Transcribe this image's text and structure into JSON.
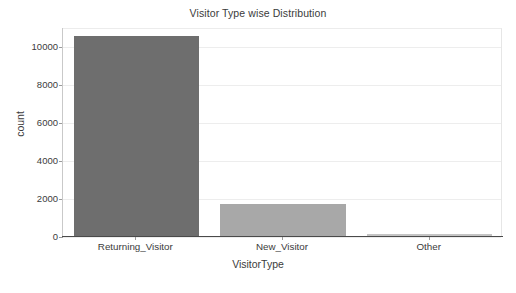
{
  "chart_data": {
    "type": "bar",
    "title": "Visitor Type wise Distribution",
    "xlabel": "VisitorType",
    "ylabel": "count",
    "categories": [
      "Returning_Visitor",
      "New_Visitor",
      "Other"
    ],
    "values": [
      10551,
      1694,
      85
    ],
    "series": [
      {
        "name": "count",
        "values": [
          10551,
          1694,
          85
        ]
      }
    ],
    "ylim": [
      0,
      10975
    ],
    "yticks": [
      0,
      2000,
      4000,
      6000,
      8000,
      10000
    ],
    "ytick_labels": [
      "0",
      "2000",
      "4000",
      "6000",
      "8000",
      "10000"
    ],
    "xtick_labels": [
      "Returning_Visitor",
      "New_Visitor",
      "Other"
    ],
    "grid": true,
    "grid_axis": "y",
    "legend": null,
    "bar_colors": [
      "#6e6e6e",
      "#a8a8a8",
      "#c4c4c4"
    ],
    "background_color": "#ffffff",
    "gridline_color": "#ededed",
    "axis_color": "#4a4a4a",
    "text_color": "#3b3b3b"
  }
}
